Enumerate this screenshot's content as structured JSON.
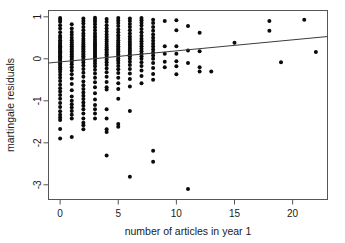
{
  "chart_data": {
    "type": "scatter",
    "title": "",
    "xlabel": "number of articles in year 1",
    "ylabel": "martingale residuals",
    "xlim": [
      -1.0,
      23.0
    ],
    "ylim": [
      -3.35,
      1.15
    ],
    "xticks": [
      0,
      5,
      10,
      15,
      20
    ],
    "xtick_labels": [
      "0",
      "5",
      "10",
      "15",
      "20"
    ],
    "yticks": [
      1,
      0,
      -1,
      -2,
      -3
    ],
    "ytick_labels": [
      "1",
      "0",
      "-1",
      "-2",
      "-3"
    ],
    "grid": false,
    "legend": null,
    "point_color": "#0b0b0b",
    "point_size": 2.0,
    "trend_line": {
      "label": "linear fit",
      "color": "#3b3b3b",
      "x_start": -1.0,
      "y_start": -0.1,
      "x_end": 23.0,
      "y_end": 0.53
    },
    "series": [
      {
        "name": "martingale residuals vs articles",
        "points": [
          [
            0,
            0.97
          ],
          [
            0,
            0.93
          ],
          [
            0,
            0.88
          ],
          [
            0,
            0.8
          ],
          [
            0,
            0.72
          ],
          [
            0,
            0.63
          ],
          [
            0,
            0.55
          ],
          [
            0,
            0.5
          ],
          [
            0,
            0.44
          ],
          [
            0,
            0.4
          ],
          [
            0,
            0.36
          ],
          [
            0,
            0.33
          ],
          [
            0,
            0.3
          ],
          [
            0,
            0.27
          ],
          [
            0,
            0.24
          ],
          [
            0,
            0.21
          ],
          [
            0,
            0.18
          ],
          [
            0,
            0.15
          ],
          [
            0,
            0.12
          ],
          [
            0,
            0.09
          ],
          [
            0,
            0.06
          ],
          [
            0,
            0.03
          ],
          [
            0,
            0.0
          ],
          [
            0,
            -0.03
          ],
          [
            0,
            -0.07
          ],
          [
            0,
            -0.11
          ],
          [
            0,
            -0.15
          ],
          [
            0,
            -0.2
          ],
          [
            0,
            -0.25
          ],
          [
            0,
            -0.31
          ],
          [
            0,
            -0.38
          ],
          [
            0,
            -0.45
          ],
          [
            0,
            -0.53
          ],
          [
            0,
            -0.62
          ],
          [
            0,
            -0.7
          ],
          [
            0,
            -0.78
          ],
          [
            0,
            -0.86
          ],
          [
            0,
            -0.95
          ],
          [
            0,
            -1.05
          ],
          [
            0,
            -1.15
          ],
          [
            0,
            -1.25
          ],
          [
            0,
            -1.33
          ],
          [
            0,
            -1.4
          ],
          [
            0,
            -1.46
          ],
          [
            0,
            -1.67
          ],
          [
            0,
            -1.9
          ],
          [
            1,
            0.82
          ],
          [
            1,
            0.72
          ],
          [
            1,
            0.64
          ],
          [
            1,
            0.57
          ],
          [
            1,
            0.5
          ],
          [
            1,
            0.44
          ],
          [
            1,
            0.39
          ],
          [
            1,
            0.34
          ],
          [
            1,
            0.3
          ],
          [
            1,
            0.26
          ],
          [
            1,
            0.22
          ],
          [
            1,
            0.18
          ],
          [
            1,
            0.14
          ],
          [
            1,
            0.1
          ],
          [
            1,
            0.06
          ],
          [
            1,
            0.02
          ],
          [
            1,
            -0.02
          ],
          [
            1,
            -0.07
          ],
          [
            1,
            -0.13
          ],
          [
            1,
            -0.2
          ],
          [
            1,
            -0.28
          ],
          [
            1,
            -0.37
          ],
          [
            1,
            -0.47
          ],
          [
            1,
            -0.6
          ],
          [
            1,
            -0.75
          ],
          [
            1,
            -0.9
          ],
          [
            1,
            -1.0
          ],
          [
            1,
            -1.08
          ],
          [
            1,
            -1.16
          ],
          [
            1,
            -1.24
          ],
          [
            1,
            -1.33
          ],
          [
            1,
            -1.42
          ],
          [
            1,
            -1.86
          ],
          [
            2,
            0.96
          ],
          [
            2,
            0.9
          ],
          [
            2,
            0.84
          ],
          [
            2,
            0.76
          ],
          [
            2,
            0.68
          ],
          [
            2,
            0.6
          ],
          [
            2,
            0.54
          ],
          [
            2,
            0.48
          ],
          [
            2,
            0.43
          ],
          [
            2,
            0.38
          ],
          [
            2,
            0.34
          ],
          [
            2,
            0.3
          ],
          [
            2,
            0.26
          ],
          [
            2,
            0.22
          ],
          [
            2,
            0.18
          ],
          [
            2,
            0.14
          ],
          [
            2,
            0.1
          ],
          [
            2,
            0.06
          ],
          [
            2,
            0.02
          ],
          [
            2,
            -0.03
          ],
          [
            2,
            -0.09
          ],
          [
            2,
            -0.16
          ],
          [
            2,
            -0.24
          ],
          [
            2,
            -0.33
          ],
          [
            2,
            -0.43
          ],
          [
            2,
            -0.54
          ],
          [
            2,
            -0.63
          ],
          [
            2,
            -0.72
          ],
          [
            2,
            -0.8
          ],
          [
            2,
            -0.88
          ],
          [
            2,
            -0.96
          ],
          [
            2,
            -1.04
          ],
          [
            2,
            -1.12
          ],
          [
            2,
            -1.2
          ],
          [
            2,
            -1.3
          ],
          [
            2,
            -1.42
          ],
          [
            2,
            -1.52
          ],
          [
            2,
            -1.58
          ],
          [
            2,
            -1.68
          ],
          [
            3,
            0.98
          ],
          [
            3,
            0.93
          ],
          [
            3,
            0.88
          ],
          [
            3,
            0.82
          ],
          [
            3,
            0.75
          ],
          [
            3,
            0.68
          ],
          [
            3,
            0.61
          ],
          [
            3,
            0.55
          ],
          [
            3,
            0.5
          ],
          [
            3,
            0.45
          ],
          [
            3,
            0.4
          ],
          [
            3,
            0.36
          ],
          [
            3,
            0.32
          ],
          [
            3,
            0.28
          ],
          [
            3,
            0.24
          ],
          [
            3,
            0.2
          ],
          [
            3,
            0.16
          ],
          [
            3,
            0.12
          ],
          [
            3,
            0.08
          ],
          [
            3,
            0.04
          ],
          [
            3,
            0.0
          ],
          [
            3,
            -0.05
          ],
          [
            3,
            -0.11
          ],
          [
            3,
            -0.18
          ],
          [
            3,
            -0.26
          ],
          [
            3,
            -0.35
          ],
          [
            3,
            -0.45
          ],
          [
            3,
            -0.56
          ],
          [
            3,
            -0.68
          ],
          [
            3,
            -0.82
          ],
          [
            3,
            -0.97
          ],
          [
            3,
            -1.1
          ],
          [
            3,
            -1.2
          ],
          [
            3,
            -1.3
          ],
          [
            3,
            -1.42
          ],
          [
            4,
            0.95
          ],
          [
            4,
            0.88
          ],
          [
            4,
            0.8
          ],
          [
            4,
            0.72
          ],
          [
            4,
            0.65
          ],
          [
            4,
            0.58
          ],
          [
            4,
            0.52
          ],
          [
            4,
            0.46
          ],
          [
            4,
            0.41
          ],
          [
            4,
            0.36
          ],
          [
            4,
            0.31
          ],
          [
            4,
            0.27
          ],
          [
            4,
            0.23
          ],
          [
            4,
            0.19
          ],
          [
            4,
            0.15
          ],
          [
            4,
            0.11
          ],
          [
            4,
            0.07
          ],
          [
            4,
            0.03
          ],
          [
            4,
            -0.02
          ],
          [
            4,
            -0.08
          ],
          [
            4,
            -0.15
          ],
          [
            4,
            -0.23
          ],
          [
            4,
            -0.32
          ],
          [
            4,
            -0.43
          ],
          [
            4,
            -0.55
          ],
          [
            4,
            -0.68
          ],
          [
            4,
            -0.73
          ],
          [
            4,
            -1.2
          ],
          [
            4,
            -1.42
          ],
          [
            4,
            -1.68
          ],
          [
            4,
            -1.74
          ],
          [
            4,
            -2.3
          ],
          [
            5,
            0.97
          ],
          [
            5,
            0.91
          ],
          [
            5,
            0.85
          ],
          [
            5,
            0.78
          ],
          [
            5,
            0.7
          ],
          [
            5,
            0.63
          ],
          [
            5,
            0.56
          ],
          [
            5,
            0.5
          ],
          [
            5,
            0.44
          ],
          [
            5,
            0.39
          ],
          [
            5,
            0.34
          ],
          [
            5,
            0.3
          ],
          [
            5,
            0.26
          ],
          [
            5,
            0.22
          ],
          [
            5,
            0.18
          ],
          [
            5,
            0.14
          ],
          [
            5,
            0.1
          ],
          [
            5,
            0.06
          ],
          [
            5,
            0.01
          ],
          [
            5,
            -0.04
          ],
          [
            5,
            -0.1
          ],
          [
            5,
            -0.17
          ],
          [
            5,
            -0.25
          ],
          [
            5,
            -0.34
          ],
          [
            5,
            -0.45
          ],
          [
            5,
            -0.58
          ],
          [
            5,
            -0.72
          ],
          [
            5,
            -0.95
          ],
          [
            5,
            -1.55
          ],
          [
            5,
            -1.62
          ],
          [
            6,
            0.96
          ],
          [
            6,
            0.9
          ],
          [
            6,
            0.83
          ],
          [
            6,
            0.76
          ],
          [
            6,
            0.68
          ],
          [
            6,
            0.6
          ],
          [
            6,
            0.53
          ],
          [
            6,
            0.47
          ],
          [
            6,
            0.41
          ],
          [
            6,
            0.36
          ],
          [
            6,
            0.31
          ],
          [
            6,
            0.26
          ],
          [
            6,
            0.21
          ],
          [
            6,
            0.16
          ],
          [
            6,
            0.11
          ],
          [
            6,
            0.06
          ],
          [
            6,
            0.0
          ],
          [
            6,
            -0.07
          ],
          [
            6,
            -0.15
          ],
          [
            6,
            -0.24
          ],
          [
            6,
            -0.35
          ],
          [
            6,
            -0.48
          ],
          [
            6,
            -0.66
          ],
          [
            6,
            -1.24
          ],
          [
            6,
            -2.81
          ],
          [
            7,
            0.97
          ],
          [
            7,
            0.92
          ],
          [
            7,
            0.86
          ],
          [
            7,
            0.79
          ],
          [
            7,
            0.71
          ],
          [
            7,
            0.63
          ],
          [
            7,
            0.55
          ],
          [
            7,
            0.48
          ],
          [
            7,
            0.42
          ],
          [
            7,
            0.36
          ],
          [
            7,
            0.3
          ],
          [
            7,
            0.24
          ],
          [
            7,
            0.18
          ],
          [
            7,
            0.12
          ],
          [
            7,
            0.06
          ],
          [
            7,
            0.0
          ],
          [
            7,
            -0.08
          ],
          [
            7,
            -0.17
          ],
          [
            7,
            -0.28
          ],
          [
            7,
            -0.41
          ],
          [
            7,
            -0.58
          ],
          [
            8,
            0.93
          ],
          [
            8,
            0.85
          ],
          [
            8,
            0.76
          ],
          [
            8,
            0.67
          ],
          [
            8,
            0.58
          ],
          [
            8,
            0.5
          ],
          [
            8,
            0.43
          ],
          [
            8,
            0.36
          ],
          [
            8,
            0.29
          ],
          [
            8,
            0.22
          ],
          [
            8,
            0.15
          ],
          [
            8,
            0.08
          ],
          [
            8,
            0.0
          ],
          [
            8,
            -0.1
          ],
          [
            8,
            -0.22
          ],
          [
            8,
            -0.36
          ],
          [
            8,
            -0.5
          ],
          [
            8,
            -2.19
          ],
          [
            8,
            -2.45
          ],
          [
            9,
            0.9
          ],
          [
            9,
            0.3
          ],
          [
            9,
            0.12
          ],
          [
            9,
            -0.07
          ],
          [
            9,
            -0.2
          ],
          [
            10,
            0.92
          ],
          [
            10,
            0.68
          ],
          [
            10,
            0.3
          ],
          [
            10,
            0.12
          ],
          [
            10,
            -0.06
          ],
          [
            10,
            -0.18
          ],
          [
            10,
            -0.37
          ],
          [
            11,
            0.78
          ],
          [
            11,
            0.2
          ],
          [
            11,
            -0.1
          ],
          [
            11,
            -3.1
          ],
          [
            12,
            0.62
          ],
          [
            12,
            0.18
          ],
          [
            12,
            -0.2
          ],
          [
            12,
            -0.3
          ],
          [
            13,
            -0.3
          ],
          [
            15,
            0.38
          ],
          [
            18,
            0.9
          ],
          [
            18,
            0.67
          ],
          [
            19,
            -0.08
          ],
          [
            21,
            0.93
          ],
          [
            22,
            0.16
          ]
        ]
      }
    ]
  },
  "figure": {
    "background_color": "#ffffff",
    "frame_color": "#555555"
  }
}
